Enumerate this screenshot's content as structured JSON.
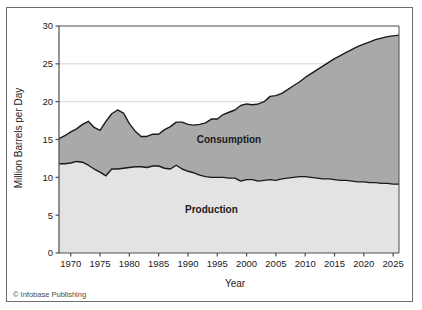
{
  "credit": "© Infobase Publishing",
  "chart_data": {
    "type": "area",
    "title": "",
    "subtitle": "",
    "xlabel": "Year",
    "ylabel": "Million Barrels per Day",
    "xlim": [
      1968,
      2026
    ],
    "ylim": [
      0,
      30
    ],
    "grid": true,
    "stacked": true,
    "legend_position": "inline-annotation",
    "xticks": [
      1970,
      1975,
      1980,
      1985,
      1990,
      1995,
      2000,
      2005,
      2010,
      2015,
      2020,
      2025
    ],
    "xtick_labels": [
      "1970",
      "1975",
      "1980",
      "1985",
      "1990",
      "1995",
      "2000",
      "2005",
      "2010",
      "2015",
      "2020",
      "2025"
    ],
    "yticks": [
      0,
      5,
      10,
      15,
      20,
      25,
      30
    ],
    "ytick_labels": [
      "0",
      "5",
      "10",
      "15",
      "20",
      "25",
      "30"
    ],
    "annotations": [
      {
        "text": "Consumption",
        "x": 1997,
        "y": 14.5
      },
      {
        "text": "Production",
        "x": 1994,
        "y": 5.3
      }
    ],
    "colors": {
      "consumption_fill": "#a9a9a9",
      "production_fill": "#e3e3e3",
      "line": "#1a1a1a",
      "grid": "#c9c9c9",
      "axis": "#4d4d4d",
      "border": "#6e6e6e",
      "background": "#ffffff"
    },
    "x": [
      1968,
      1969,
      1970,
      1971,
      1972,
      1973,
      1974,
      1975,
      1976,
      1977,
      1978,
      1979,
      1980,
      1981,
      1982,
      1983,
      1984,
      1985,
      1986,
      1987,
      1988,
      1989,
      1990,
      1991,
      1992,
      1993,
      1994,
      1995,
      1996,
      1997,
      1998,
      1999,
      2000,
      2001,
      2002,
      2003,
      2004,
      2005,
      2006,
      2007,
      2008,
      2009,
      2010,
      2011,
      2012,
      2013,
      2014,
      2015,
      2016,
      2017,
      2018,
      2019,
      2020,
      2021,
      2022,
      2023,
      2024,
      2025,
      2026
    ],
    "series": [
      {
        "name": "Consumption",
        "values": [
          15.1,
          15.5,
          16.0,
          16.4,
          17.0,
          17.4,
          16.6,
          16.2,
          17.4,
          18.4,
          18.9,
          18.5,
          17.1,
          16.1,
          15.4,
          15.4,
          15.7,
          15.7,
          16.3,
          16.7,
          17.3,
          17.3,
          17.0,
          16.9,
          17.0,
          17.2,
          17.7,
          17.7,
          18.3,
          18.6,
          18.9,
          19.5,
          19.7,
          19.6,
          19.7,
          20.0,
          20.7,
          20.8,
          21.1,
          21.6,
          22.1,
          22.6,
          23.2,
          23.7,
          24.2,
          24.7,
          25.2,
          25.7,
          26.1,
          26.5,
          26.9,
          27.3,
          27.6,
          27.9,
          28.2,
          28.4,
          28.6,
          28.7,
          28.8
        ]
      },
      {
        "name": "Production",
        "values": [
          11.8,
          11.8,
          11.9,
          12.1,
          12.0,
          11.6,
          11.1,
          10.7,
          10.2,
          11.1,
          11.1,
          11.2,
          11.3,
          11.4,
          11.4,
          11.3,
          11.5,
          11.5,
          11.2,
          11.1,
          11.6,
          11.1,
          10.8,
          10.6,
          10.3,
          10.1,
          10.0,
          10.0,
          10.0,
          9.9,
          9.9,
          9.5,
          9.7,
          9.7,
          9.5,
          9.6,
          9.7,
          9.6,
          9.8,
          9.9,
          10.0,
          10.1,
          10.1,
          10.0,
          9.9,
          9.8,
          9.8,
          9.7,
          9.6,
          9.6,
          9.5,
          9.4,
          9.4,
          9.3,
          9.3,
          9.2,
          9.2,
          9.1,
          9.1
        ]
      }
    ]
  }
}
